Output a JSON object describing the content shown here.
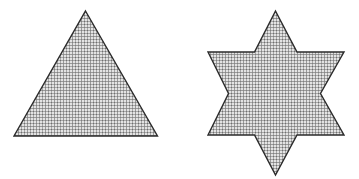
{
  "figure": {
    "name": "two-shaded-geometric-shapes",
    "canvas": {
      "width": 359,
      "height": 179,
      "background_color": "#ffffff"
    },
    "style": {
      "stroke_color": "#2b2b2b",
      "stroke_width": 1.4,
      "fill_pattern": "fine-gray-crosshatch",
      "fill_base_color": "#d9d9d9",
      "fill_line_color": "#9a9a9a",
      "fill_dot_color": "#7d7d7d",
      "pattern_cell_px": 3
    },
    "shapes": [
      {
        "id": "triangle",
        "label": "triangle",
        "kind": "polygon",
        "sides": 3,
        "description": "upward-pointing isosceles triangle",
        "points": "85.5,11 157.5,136 14,136",
        "vertices": [
          {
            "x": 85.5,
            "y": 11
          },
          {
            "x": 157.5,
            "y": 136
          },
          {
            "x": 14,
            "y": 136
          }
        ],
        "bbox": {
          "x": 14,
          "y": 11,
          "width": 143.5,
          "height": 125
        }
      },
      {
        "id": "six-pointed-star",
        "label": "six-pointed star",
        "kind": "polygon",
        "sides": 12,
        "points_count": 6,
        "description": "six-pointed hexagram star",
        "points": "275.5,11 297,52 344,52 320.5,93.5 344,135 297,135 275.5,175 254.5,135 208,135 228.5,93.5 208,52 254.5,52",
        "vertices": [
          {
            "x": 275.5,
            "y": 11
          },
          {
            "x": 297,
            "y": 52
          },
          {
            "x": 344,
            "y": 52
          },
          {
            "x": 320.5,
            "y": 93.5
          },
          {
            "x": 344,
            "y": 135
          },
          {
            "x": 297,
            "y": 135
          },
          {
            "x": 275.5,
            "y": 175
          },
          {
            "x": 254.5,
            "y": 135
          },
          {
            "x": 208,
            "y": 135
          },
          {
            "x": 228.5,
            "y": 93.5
          },
          {
            "x": 208,
            "y": 52
          },
          {
            "x": 254.5,
            "y": 52
          }
        ],
        "bbox": {
          "x": 208,
          "y": 11,
          "width": 136,
          "height": 164
        }
      }
    ]
  }
}
